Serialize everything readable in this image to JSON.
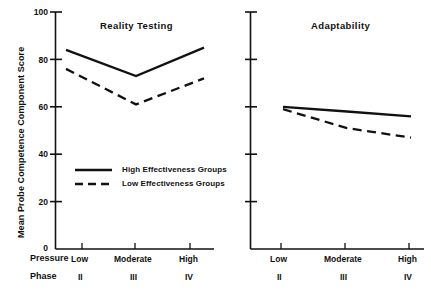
{
  "chart_data": {
    "type": "line",
    "title": "",
    "ylabel": "Mean Probe Competence Component Score",
    "xlabel": "",
    "ylim": [
      0,
      100
    ],
    "yticks": [
      0,
      20,
      40,
      60,
      80,
      100
    ],
    "ytick_labels": [
      "0",
      "20",
      "40",
      "60",
      "80",
      "100"
    ],
    "grid": false,
    "categories": [
      "Low",
      "Moderate",
      "High"
    ],
    "category_row_label": "Pressure",
    "phase_row_label": "Phase",
    "phases": [
      "II",
      "III",
      "IV"
    ],
    "legend_position": "inside-lower-left-panel",
    "legend": [
      {
        "name": "High Effectiveness Groups",
        "style": "solid"
      },
      {
        "name": "Low Effectiveness Groups",
        "style": "dashed"
      }
    ],
    "panels": [
      {
        "title": "Reality Testing",
        "series": [
          {
            "name": "High Effectiveness Groups",
            "style": "solid",
            "values": [
              84,
              73,
              85
            ]
          },
          {
            "name": "Low Effectiveness Groups",
            "style": "dashed",
            "values": [
              76,
              61,
              72
            ]
          }
        ]
      },
      {
        "title": "Adaptability",
        "series": [
          {
            "name": "High Effectiveness Groups",
            "style": "solid",
            "values": [
              60,
              58,
              56
            ]
          },
          {
            "name": "Low Effectiveness Groups",
            "style": "dashed",
            "values": [
              59,
              51,
              47
            ]
          }
        ]
      }
    ]
  },
  "axis": {
    "y_title": "Mean Probe Competence Component Score",
    "ticks": {
      "t100": "100",
      "t80": "80",
      "t60": "60",
      "t40": "40",
      "t20": "20",
      "t0": "0"
    }
  },
  "left_panel": {
    "title": "Reality Testing"
  },
  "right_panel": {
    "title": "Adaptability"
  },
  "xaxis": {
    "pressure_label": "Pressure",
    "phase_label": "Phase",
    "cat_low": "Low",
    "cat_moderate": "Moderate",
    "cat_high": "High",
    "phase_ii": "II",
    "phase_iii": "III",
    "phase_iv": "IV"
  },
  "legend": {
    "high_label": "High Effectiveness Groups",
    "low_label": "Low Effectiveness Groups"
  },
  "colors": {
    "ink": "#111111",
    "background": "#ffffff"
  }
}
